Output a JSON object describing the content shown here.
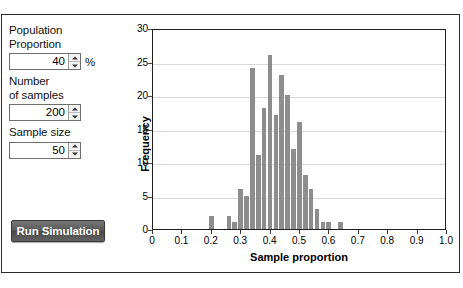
{
  "controls": {
    "population_proportion": {
      "label_line1": "Population",
      "label_line2": "Proportion",
      "value": "40",
      "unit": "%"
    },
    "number_of_samples": {
      "label_line1": "Number",
      "label_line2": "of samples",
      "value": "200"
    },
    "sample_size": {
      "label_line1": "Sample size",
      "value": "50"
    },
    "run_button_label": "Run Simulation"
  },
  "colors": {
    "bar_fill": "#8d8d8d",
    "grid": "#d9d9d9",
    "axis": "#1f1f1f",
    "button_text": "#ffffff"
  },
  "chart_data": {
    "type": "bar",
    "title": "",
    "xlabel": "Sample proportion",
    "ylabel": "Frequency",
    "xlim": [
      0,
      1.0
    ],
    "ylim": [
      0,
      30
    ],
    "grid": true,
    "legend": false,
    "bin_width": 0.02,
    "xticks": [
      "0",
      "0.1",
      "0.2",
      "0.3",
      "0.4",
      "0.5",
      "0.6",
      "0.7",
      "0.8",
      "0.9",
      "1.0"
    ],
    "xtick_values": [
      0,
      0.1,
      0.2,
      0.3,
      0.4,
      0.5,
      0.6,
      0.7,
      0.8,
      0.9,
      1.0
    ],
    "yticks": [
      "0",
      "5",
      "10",
      "15",
      "20",
      "25",
      "30"
    ],
    "ytick_values": [
      0,
      5,
      10,
      15,
      20,
      25,
      30
    ],
    "categories": [
      0.2,
      0.26,
      0.28,
      0.3,
      0.32,
      0.34,
      0.36,
      0.38,
      0.4,
      0.42,
      0.44,
      0.46,
      0.48,
      0.5,
      0.52,
      0.54,
      0.56,
      0.58,
      0.6,
      0.64
    ],
    "values": [
      2,
      2,
      1,
      6,
      5,
      24,
      11,
      18,
      26,
      17,
      23,
      20,
      12,
      16,
      8,
      6,
      3,
      1,
      1,
      1
    ]
  }
}
